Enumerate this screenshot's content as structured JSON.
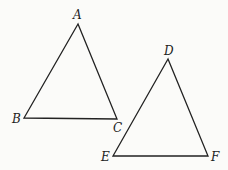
{
  "figure": {
    "triangles": [
      {
        "name": "triangle-ABC",
        "vertices": [
          {
            "label": "A",
            "x": 78,
            "y": 24
          },
          {
            "label": "B",
            "x": 24,
            "y": 118
          },
          {
            "label": "C",
            "x": 117,
            "y": 119
          }
        ]
      },
      {
        "name": "triangle-DEF",
        "vertices": [
          {
            "label": "D",
            "x": 168,
            "y": 59
          },
          {
            "label": "E",
            "x": 113,
            "y": 156
          },
          {
            "label": "F",
            "x": 208,
            "y": 156
          }
        ]
      }
    ],
    "labels": {
      "A": "A",
      "B": "B",
      "C": "C",
      "D": "D",
      "E": "E",
      "F": "F"
    },
    "colors": {
      "stroke": "#222222",
      "background": "#fbfbf9"
    }
  }
}
